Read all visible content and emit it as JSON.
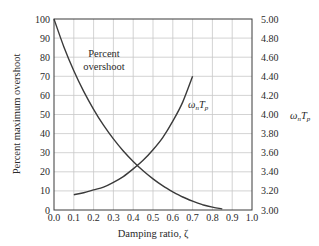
{
  "chart_data": [
    {
      "type": "line",
      "title": "",
      "xlabel": "Damping ratio, ζ",
      "ylabel": "Percent maximum overshoot",
      "xlim": [
        0.0,
        1.0
      ],
      "ylim": [
        0,
        100
      ],
      "x_ticks": [
        "0.0",
        "0.1",
        "0.2",
        "0.3",
        "0.4",
        "0.5",
        "0.6",
        "0.7",
        "0.8",
        "0.9",
        "1.0"
      ],
      "y_ticks": [
        "0",
        "10",
        "20",
        "30",
        "40",
        "50",
        "60",
        "70",
        "80",
        "90",
        "100"
      ],
      "grid": true,
      "series": [
        {
          "name": "Percent overshoot",
          "axis": "left",
          "x": [
            0.0,
            0.05,
            0.1,
            0.15,
            0.2,
            0.25,
            0.3,
            0.35,
            0.4,
            0.45,
            0.5,
            0.55,
            0.6,
            0.65,
            0.7,
            0.75,
            0.8,
            0.85
          ],
          "y": [
            100,
            85.4,
            72.9,
            62.1,
            52.7,
            44.4,
            37.2,
            30.9,
            25.4,
            20.5,
            16.3,
            12.6,
            9.5,
            6.8,
            4.6,
            2.8,
            1.5,
            0.6
          ]
        },
        {
          "name": "ωnTp",
          "axis": "right",
          "x": [
            0.1,
            0.15,
            0.2,
            0.25,
            0.3,
            0.35,
            0.4,
            0.45,
            0.5,
            0.55,
            0.6,
            0.65,
            0.7
          ],
          "y": [
            3.16,
            3.18,
            3.21,
            3.24,
            3.29,
            3.35,
            3.43,
            3.52,
            3.63,
            3.76,
            3.93,
            4.13,
            4.4
          ]
        }
      ],
      "secondary_axis": {
        "label": "ωnTp",
        "ylim": [
          3.0,
          5.0
        ],
        "y_ticks": [
          "3.00",
          "3.20",
          "3.40",
          "3.60",
          "3.80",
          "4.00",
          "4.20",
          "4.40",
          "4.60",
          "4.80",
          "5.00"
        ]
      },
      "annotations": [
        {
          "text_line1": "Percent",
          "text_line2": "overshoot"
        },
        {
          "text": "ωnTp"
        }
      ]
    }
  ],
  "labels": {
    "ylabel": "Percent maximum overshoot",
    "xlabel": "Damping ratio, ζ",
    "right_label_base": "ω",
    "right_label_sub": "n",
    "right_label_T": "T",
    "right_label_tsub": "p",
    "annot_pos_line1": "Percent",
    "annot_pos_line2": "overshoot"
  }
}
